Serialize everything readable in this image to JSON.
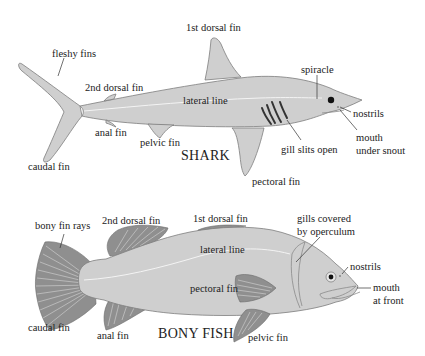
{
  "diagram": {
    "colors": {
      "body_fill": "#cfcfcf",
      "body_stroke": "#7d7d7d",
      "ray_fin_fill": "#8f8f8f",
      "lateral_line": "#f4f4f4",
      "label_text": "#222222",
      "background": "#ffffff"
    },
    "shark": {
      "title": "SHARK",
      "labels": {
        "first_dorsal_fin": "1st dorsal fin",
        "fleshy_fins": "fleshy fins",
        "second_dorsal_fin": "2nd dorsal fin",
        "lateral_line": "lateral line",
        "spiracle": "spiracle",
        "nostrils": "nostrils",
        "mouth_line1": "mouth",
        "mouth_line2": "under snout",
        "anal_fin": "anal fin",
        "pelvic_fin": "pelvic fin",
        "gill_slits": "gill slits open",
        "caudal_fin": "caudal fin",
        "pectoral_fin": "pectoral fin"
      }
    },
    "bony_fish": {
      "title": "BONY FISH",
      "labels": {
        "bony_fin_rays": "bony fin rays",
        "second_dorsal_fin": "2nd dorsal fin",
        "first_dorsal_fin": "1st dorsal fin",
        "gills_line1": "gills covered",
        "gills_line2": "by operculum",
        "lateral_line": "lateral line",
        "nostrils": "nostrils",
        "pectoral_fin": "pectoral fin",
        "mouth_line1": "mouth",
        "mouth_line2": "at front",
        "caudal_fin": "caudal fin",
        "anal_fin": "anal fin",
        "pelvic_fin": "pelvic fin"
      }
    }
  }
}
